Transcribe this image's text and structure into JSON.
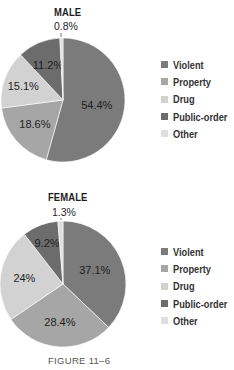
{
  "chart_data": [
    {
      "type": "pie",
      "title": "MALE",
      "categories": [
        "Violent",
        "Property",
        "Drug",
        "Public-order",
        "Other"
      ],
      "values": [
        54.4,
        18.6,
        15.1,
        11.2,
        0.8
      ],
      "labels": [
        "54.4%",
        "18.6%",
        "15.1%",
        "11.2%",
        "0.8%"
      ],
      "colors": [
        "#7b7b7b",
        "#a6a6a6",
        "#d2d2d2",
        "#6c6c6c",
        "#dedede"
      ],
      "start": "12 o'clock",
      "direction": "clockwise",
      "legend_position": "right"
    },
    {
      "type": "pie",
      "title": "FEMALE",
      "categories": [
        "Violent",
        "Property",
        "Drug",
        "Public-order",
        "Other"
      ],
      "values": [
        37.1,
        28.4,
        24,
        9.2,
        1.3
      ],
      "labels": [
        "37.1%",
        "28.4%",
        "24%",
        "9.2%",
        "1.3%"
      ],
      "colors": [
        "#7b7b7b",
        "#a6a6a6",
        "#d2d2d2",
        "#6c6c6c",
        "#dedede"
      ],
      "start": "12 o'clock",
      "direction": "clockwise",
      "legend_position": "right"
    }
  ],
  "caption": "FIGURE 11–6"
}
